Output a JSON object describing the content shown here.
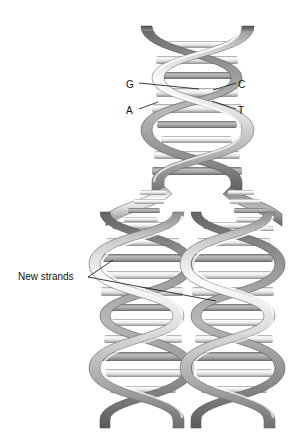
{
  "figure": {
    "background_color": "#ffffff",
    "width": 289,
    "height": 436
  },
  "labels": {
    "base_G": "G",
    "base_C": "C",
    "base_A": "A",
    "base_T": "T",
    "new_strands": "New strands"
  },
  "colors": {
    "ribbon_light": "#e8e8e8",
    "ribbon_mid": "#b4b4b4",
    "ribbon_dark": "#7a7a7a",
    "ribbon_shadow": "#5f5f5f",
    "rung_light": "#fbfbfb",
    "rung_mid": "#c9c9c9",
    "rung_dark": "#8e8e8e",
    "leader_line": "#1a1a1a",
    "text": "#111111"
  },
  "structure": {
    "parent_helix": {
      "name": "parent-double-helix",
      "x_center": 197,
      "top": 22,
      "bottom": 200,
      "width": 100,
      "turns": 3
    },
    "fork": {
      "name": "replication-fork",
      "y": 195,
      "description": "Parent helix unwinds into two daughter helices with unpaired base stubs"
    },
    "daughter_helix_left": {
      "name": "daughter-helix-left",
      "x_center": 142,
      "top": 200,
      "bottom": 428,
      "width": 88,
      "turns": 4
    },
    "daughter_helix_right": {
      "name": "daughter-helix-right",
      "x_center": 233,
      "top": 200,
      "bottom": 428,
      "width": 88,
      "turns": 4
    }
  },
  "leader_lines": {
    "G": {
      "from_x": 139,
      "from_y": 83,
      "to_x": 196,
      "to_y": 89
    },
    "C": {
      "from_x": 236,
      "from_y": 83,
      "to_x": 214,
      "to_y": 90
    },
    "A": {
      "from_x": 139,
      "from_y": 109,
      "to_x": 157,
      "to_y": 102
    },
    "T": {
      "from_x": 236,
      "from_y": 109,
      "to_x": 212,
      "to_y": 101
    },
    "new_strands_upper": {
      "from_x": 88,
      "from_y": 277,
      "to_x": 113,
      "to_y": 260
    },
    "new_strands_lower": {
      "from_x": 88,
      "from_y": 277,
      "to_x": 216,
      "to_y": 301
    }
  }
}
